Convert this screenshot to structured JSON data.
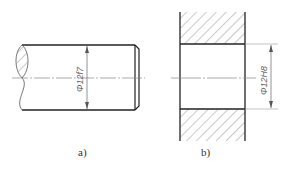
{
  "figure": {
    "part_a": {
      "label": "a)",
      "description": "shaft",
      "dimension": "Φ12f7"
    },
    "part_b": {
      "label": "b)",
      "description": "hole",
      "dimension": "Φ12H8"
    },
    "colors": {
      "outline": "#222222",
      "thin": "#888888",
      "hatch": "#777777",
      "background": "#ffffff"
    }
  }
}
